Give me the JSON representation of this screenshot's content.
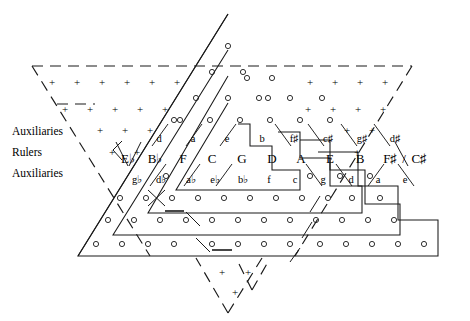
{
  "figure": {
    "side_labels": [
      {
        "id": "aux-top",
        "text": "Auxiliaries"
      },
      {
        "id": "rulers",
        "text": "Rulers"
      },
      {
        "id": "aux-bottom",
        "text": "Auxiliaries"
      }
    ],
    "rows": {
      "upper_auxiliaries": {
        "label": "Auxiliaries",
        "items": [
          "d",
          "a",
          "e",
          "b",
          "f♯",
          "c♯",
          "g♯",
          "d♯"
        ]
      },
      "rulers": {
        "label": "Rulers",
        "items": [
          "E♭",
          "B♭",
          "F",
          "C",
          "G",
          "D",
          "A",
          "E",
          "B",
          "F♯",
          "/",
          "C♯"
        ]
      },
      "lower_auxiliaries": {
        "label": "Auxiliaries",
        "items": [
          "g♭",
          "d♭",
          "a♭",
          "e♭",
          "b♭",
          "f",
          "c",
          "g",
          "d",
          "a",
          "e"
        ]
      }
    },
    "markers": {
      "plus_symbol": "+",
      "circle_symbol": "o",
      "plus_region": "upper and lower dashed auxiliary zones",
      "circle_region": "lower nested triangle bands"
    },
    "colors": {
      "ink": "#1a1a1a",
      "background": "#ffffff"
    },
    "geometry": {
      "outer_triangles": 4,
      "dashed_outline": true,
      "inverted_bottom_triangle": true
    }
  }
}
